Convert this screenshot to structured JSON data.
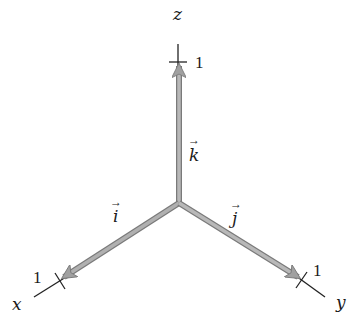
{
  "diagram": {
    "type": "3d-coordinate-axes-unit-vectors",
    "origin": {
      "x": 179,
      "y": 203
    },
    "axes": [
      {
        "name": "z",
        "label": "z",
        "tick_label": "1",
        "tick": {
          "x": 178,
          "y": 62
        },
        "end": {
          "x": 178,
          "y": 44
        },
        "label_pos": {
          "x": 173,
          "y": 20
        },
        "tick_label_pos": {
          "x": 196,
          "y": 68
        }
      },
      {
        "name": "x",
        "label": "x",
        "tick_label": "1",
        "tick": {
          "x": 60,
          "y": 281
        },
        "end": {
          "x": 34,
          "y": 297
        },
        "label_pos": {
          "x": 12,
          "y": 310
        },
        "tick_label_pos": {
          "x": 33,
          "y": 281
        }
      },
      {
        "name": "y",
        "label": "y",
        "tick_label": "1",
        "tick": {
          "x": 302,
          "y": 280
        },
        "end": {
          "x": 325,
          "y": 297
        },
        "label_pos": {
          "x": 338,
          "y": 310
        },
        "tick_label_pos": {
          "x": 313,
          "y": 275
        }
      }
    ],
    "vectors": [
      {
        "name": "k",
        "label": "k",
        "arrow": "→",
        "label_pos": {
          "x": 193,
          "y": 160
        }
      },
      {
        "name": "i",
        "label": "i",
        "arrow": "→",
        "label_pos": {
          "x": 114,
          "y": 220
        }
      },
      {
        "name": "j",
        "label": "j",
        "arrow": "→",
        "label_pos": {
          "x": 234,
          "y": 221
        }
      }
    ],
    "colors": {
      "vector": "#a6a6a6",
      "vector_edge": "#7a7a7a",
      "axis_line": "#222222",
      "text": "#1a1a1a"
    }
  }
}
